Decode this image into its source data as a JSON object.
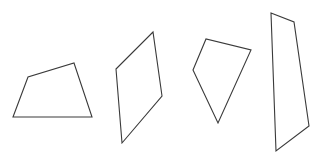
{
  "diagram": {
    "background": "#ffffff",
    "stroke_color": "#3a3a3a",
    "shapes": [
      {
        "name": "quadrilateral-1",
        "type": "trapezoid",
        "points": "13,117 28,77 74,63 92,117"
      },
      {
        "name": "quadrilateral-2",
        "type": "parallelogram",
        "points": "116,69 153,32 162,96 122,143"
      },
      {
        "name": "quadrilateral-3",
        "type": "kite",
        "points": "193,70 206,39 251,50 218,123"
      },
      {
        "name": "quadrilateral-4",
        "type": "quadrilateral",
        "points": "271,13 294,22 309,126 276,151"
      }
    ]
  }
}
